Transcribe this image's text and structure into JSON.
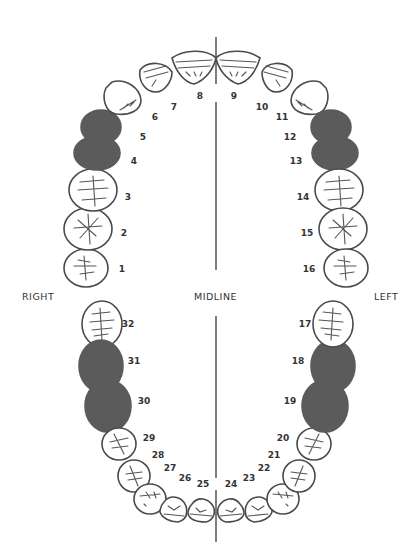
{
  "diagram": {
    "type": "dental-chart-universal-numbering",
    "labels": {
      "right": "RIGHT",
      "midline": "MIDLINE",
      "left": "LEFT"
    },
    "colors": {
      "missing_fill": "#5b5b5b",
      "outline": "#4a4a4a",
      "background": "#ffffff"
    },
    "upper_arch": [
      {
        "number": "1",
        "missing": false
      },
      {
        "number": "2",
        "missing": false
      },
      {
        "number": "3",
        "missing": false
      },
      {
        "number": "4",
        "missing": true
      },
      {
        "number": "5",
        "missing": true
      },
      {
        "number": "6",
        "missing": false
      },
      {
        "number": "7",
        "missing": false
      },
      {
        "number": "8",
        "missing": false
      },
      {
        "number": "9",
        "missing": false
      },
      {
        "number": "10",
        "missing": false
      },
      {
        "number": "11",
        "missing": false
      },
      {
        "number": "12",
        "missing": true
      },
      {
        "number": "13",
        "missing": true
      },
      {
        "number": "14",
        "missing": false
      },
      {
        "number": "15",
        "missing": false
      },
      {
        "number": "16",
        "missing": false
      }
    ],
    "lower_arch": [
      {
        "number": "17",
        "missing": false
      },
      {
        "number": "18",
        "missing": true
      },
      {
        "number": "19",
        "missing": true
      },
      {
        "number": "20",
        "missing": false
      },
      {
        "number": "21",
        "missing": false
      },
      {
        "number": "22",
        "missing": false
      },
      {
        "number": "23",
        "missing": false
      },
      {
        "number": "24",
        "missing": false
      },
      {
        "number": "25",
        "missing": false
      },
      {
        "number": "26",
        "missing": false
      },
      {
        "number": "27",
        "missing": false
      },
      {
        "number": "28",
        "missing": false
      },
      {
        "number": "29",
        "missing": false
      },
      {
        "number": "30",
        "missing": true
      },
      {
        "number": "31",
        "missing": true
      },
      {
        "number": "32",
        "missing": false
      }
    ]
  }
}
